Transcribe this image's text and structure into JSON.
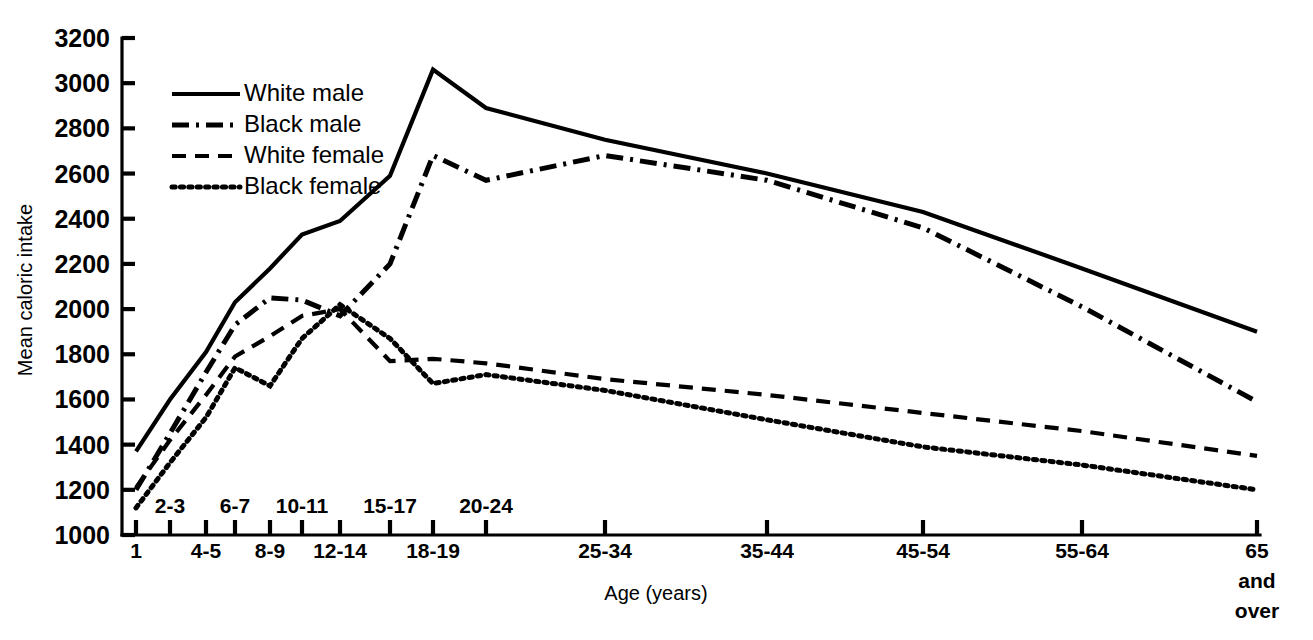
{
  "chart_data": {
    "type": "line",
    "title": "",
    "xlabel": "Age (years)",
    "ylabel": "Mean caloric intake",
    "ylim": [
      1000,
      3200
    ],
    "ytick_step": 200,
    "yticks": [
      1000,
      1200,
      1400,
      1600,
      1800,
      2000,
      2200,
      2400,
      2600,
      2800,
      3000,
      3200
    ],
    "ytick_labels": [
      "1000",
      "1200",
      "1400",
      "1600",
      "1800",
      "2000",
      "2200",
      "2400",
      "2600",
      "2800",
      "3000",
      "3200"
    ],
    "categories": [
      "1",
      "2-3",
      "4-5",
      "6-7",
      "8-9",
      "10-11",
      "12-14",
      "15-17",
      "18-19",
      "20-24",
      "25-34",
      "35-44",
      "45-54",
      "55-64",
      "65 and over"
    ],
    "xtick_labels": [
      "1",
      "2-3",
      "4-5",
      "6-7",
      "8-9",
      "10-11",
      "12-14",
      "15-17",
      "18-19",
      "20-24",
      "25-34",
      "35-44",
      "45-54",
      "55-64",
      "65"
    ],
    "xtick_label_extra_lines": [
      "",
      "",
      "",
      "",
      "",
      "",
      "",
      "",
      "",
      "",
      "",
      "",
      "",
      "",
      "and|over"
    ],
    "xtick_rows": [
      "bottom",
      "top",
      "bottom",
      "top",
      "bottom",
      "top",
      "bottom",
      "top",
      "bottom",
      "top",
      "bottom",
      "bottom",
      "bottom",
      "bottom",
      "bottom"
    ],
    "grid": false,
    "legend_position": "upper-left-inside",
    "series": [
      {
        "name": "White male",
        "style": "solid",
        "values": [
          1370,
          1600,
          1810,
          2030,
          2180,
          2330,
          2390,
          2590,
          3060,
          2890,
          2750,
          2600,
          2430,
          2180,
          1900
        ]
      },
      {
        "name": "Black male",
        "style": "dash-dot",
        "values": [
          1200,
          1450,
          1720,
          1930,
          2050,
          2040,
          1970,
          2200,
          2680,
          2570,
          2680,
          2570,
          2360,
          2010,
          1590
        ]
      },
      {
        "name": "White female",
        "style": "dashed",
        "values": [
          1210,
          1420,
          1620,
          1790,
          1880,
          1970,
          2000,
          1770,
          1780,
          1760,
          1690,
          1620,
          1540,
          1460,
          1350
        ]
      },
      {
        "name": "Black female",
        "style": "dotted",
        "values": [
          1120,
          1320,
          1520,
          1740,
          1660,
          1870,
          2020,
          1870,
          1670,
          1710,
          1640,
          1510,
          1390,
          1310,
          1200
        ]
      }
    ]
  },
  "legend": {
    "items": [
      {
        "label": "White male",
        "style": "solid"
      },
      {
        "label": "Black male",
        "style": "dash-dot"
      },
      {
        "label": "White female",
        "style": "dashed"
      },
      {
        "label": "Black female",
        "style": "dotted"
      }
    ]
  }
}
